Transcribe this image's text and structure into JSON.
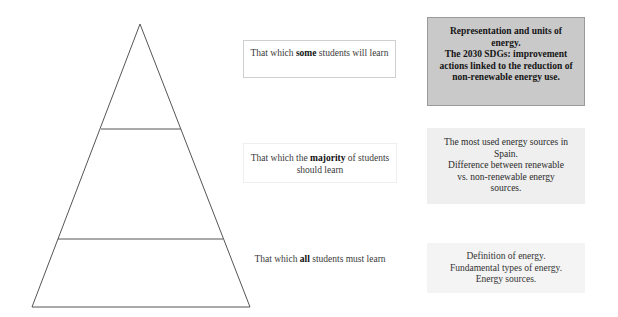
{
  "diagram": {
    "type": "learning-pyramid",
    "pyramid": {
      "levels": 3,
      "stroke_color": "#555555"
    },
    "levels": [
      {
        "id": "some",
        "label_prefix": "That which ",
        "label_emphasis": "some",
        "label_suffix": " students will learn",
        "content_lines": [
          "Representation and units of",
          "energy.",
          "The 2030 SDGs: improvement",
          "actions linked to the reduction of",
          "non-renewable energy use."
        ],
        "fill_color": "#c9c9c9"
      },
      {
        "id": "majority",
        "label_prefix": "That which the ",
        "label_emphasis": "majority",
        "label_suffix": " of students should learn",
        "content_lines": [
          "The most used energy sources in",
          "Spain.",
          "Difference between renewable",
          "vs. non-renewable energy",
          "sources."
        ],
        "fill_color": "#efefef"
      },
      {
        "id": "all",
        "label_prefix": "That which ",
        "label_emphasis": "all",
        "label_suffix": " students must learn",
        "content_lines": [
          "Definition of energy.",
          "Fundamental types of energy.",
          "Energy sources."
        ],
        "fill_color": "#f4f4f4"
      }
    ]
  }
}
